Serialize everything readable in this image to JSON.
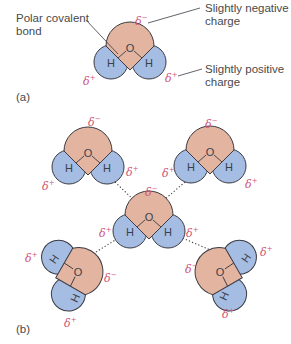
{
  "figure": {
    "panel_a": {
      "label": "(a)",
      "annotations": {
        "bond": [
          "Polar covalent",
          "bond"
        ],
        "negative": [
          "Slightly negative",
          "charge"
        ],
        "positive": [
          "Slightly positive",
          "charge"
        ]
      }
    },
    "panel_b": {
      "label": "(b)"
    },
    "atoms": {
      "oxygen": "O",
      "hydrogen": "H"
    },
    "charges": {
      "delta": "δ",
      "minus": "−",
      "plus": "+"
    },
    "colors": {
      "oxygen_fill": "#e3b49f",
      "hydrogen_fill": "#a5bde3",
      "outline": "#3b3b44",
      "delta_text": "#d0567a",
      "label_text": "#4a4a4a",
      "hydrogen_bond": "#3b3b44"
    }
  }
}
